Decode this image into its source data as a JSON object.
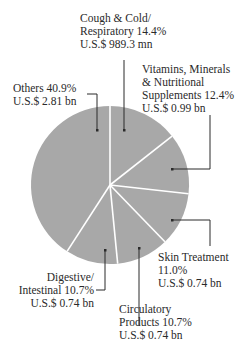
{
  "chart_data": {
    "type": "pie",
    "title": "",
    "start_angle_deg": 0,
    "direction": "clockwise",
    "slice_color": "#a8a8a8",
    "divider_color": "#ffffff",
    "slices": [
      {
        "name": "Cough & Cold/ Respiratory",
        "percent": 14.4,
        "value_label": "U.S.$ 989.3 mn"
      },
      {
        "name": "Vitamins, Minerals & Nutritional Supplements",
        "percent": 12.4,
        "value_label": "U.S.$ 0.99 bn"
      },
      {
        "name": "Skin Treatment",
        "percent": 11.0,
        "value_label": "U.S.$ 0.74 bn"
      },
      {
        "name": "Circulatory Products",
        "percent": 10.7,
        "value_label": "U.S.$ 0.74 bn"
      },
      {
        "name": "Digestive/ Intestinal",
        "percent": 10.7,
        "value_label": "U.S.$ 0.74 bn"
      },
      {
        "name": "Others",
        "percent": 40.9,
        "value_label": "U.S.$ 2.81 bn"
      }
    ],
    "legend": "none (callout labels with leader lines)"
  },
  "labels": {
    "cough": {
      "line1": "Cough & Cold/",
      "line2": "Respiratory  14.4%",
      "line3": "U.S.$ 989.3 mn"
    },
    "vitamins": {
      "line1": "Vitamins, Minerals",
      "line2": "& Nutritional",
      "line3": "Supplements 12.4%",
      "line4": "U.S.$ 0.99 bn"
    },
    "others": {
      "line1": "Others 40.9%",
      "line2": "U.S.$ 2.81 bn"
    },
    "skin": {
      "line1": "Skin Treatment",
      "line2": "11.0%",
      "line3": "U.S.$ 0.74 bn"
    },
    "circulatory": {
      "line1": "Circulatory",
      "line2": "Products  10.7%",
      "line3": "U.S.$ 0.74 bn"
    },
    "digestive": {
      "line1": "Digestive/",
      "line2": "Intestinal  10.7%",
      "line3": "U.S.$ 0.74 bn"
    }
  }
}
